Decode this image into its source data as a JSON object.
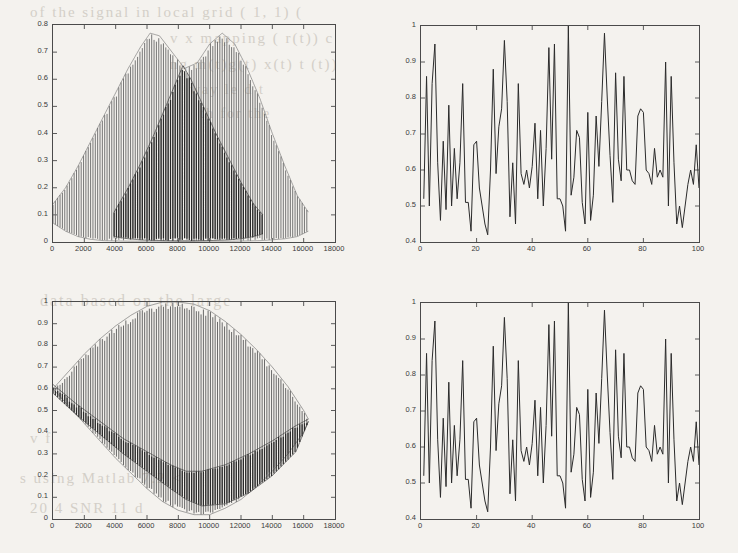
{
  "figure": {
    "background_color": "#f4f2ee",
    "axis_color": "#4a4a4a",
    "trace_color": "#2b2b2b",
    "panel_count": 4
  },
  "bleed_text": [
    "of the  signal in  local grid   (  1, 1)  ( ",
    "v   x    mapping  (   r(t))    c",
    "ng   m(t)g(t)        x(t)          t   (t))",
    "way  le                 d  t",
    "th   for   the",
    "data based on the large",
    "v   f",
    "s  using Matlab 7.2 <",
    "20    4  SNR 11  d"
  ],
  "panels": [
    {
      "id": "top-left",
      "name": "composite-modulated-signal-plot",
      "chart_data": {
        "type": "line",
        "title": "",
        "xlabel": "",
        "ylabel": "",
        "xlim": [
          0,
          18000
        ],
        "ylim": [
          0,
          0.8
        ],
        "xticks": [
          0,
          2000,
          4000,
          6000,
          8000,
          10000,
          12000,
          14000,
          16000,
          18000
        ],
        "yticks": [
          0,
          0.1,
          0.2,
          0.3,
          0.4,
          0.5,
          0.6,
          0.7,
          0.8
        ],
        "xtick_labels": [
          "0",
          "2000",
          "4000",
          "6000",
          "8000",
          "10000",
          "12000",
          "14000",
          "16000",
          "18000"
        ],
        "ytick_labels": [
          "0",
          "0.1",
          "0.2",
          "0.3",
          "0.4",
          "0.5",
          "0.6",
          "0.7",
          "0.8"
        ],
        "grid": false,
        "legend": "none",
        "description": "Dense high-frequency oscillation filling two overlapping bell envelopes plus a darker inner triangular envelope.",
        "data_extent_x": [
          0,
          16300
        ],
        "oscillation_period_x": 150,
        "envelopes": [
          {
            "name": "outer-envelope-hump-1",
            "shade": "#6b6b6b",
            "x": [
              0,
              800,
              1600,
              2400,
              3200,
              4000,
              4800,
              5600,
              6200,
              6800,
              7600,
              8400,
              9200,
              10000,
              10800,
              11600,
              12400,
              13200,
              14000,
              14800,
              15600,
              16300
            ],
            "y_upper": [
              0.14,
              0.2,
              0.28,
              0.37,
              0.46,
              0.55,
              0.64,
              0.72,
              0.77,
              0.76,
              0.7,
              0.64,
              0.66,
              0.73,
              0.77,
              0.73,
              0.64,
              0.53,
              0.4,
              0.28,
              0.17,
              0.11
            ],
            "y_lower": [
              0.07,
              0.04,
              0.02,
              0.01,
              0.005,
              0.004,
              0.003,
              0.003,
              0.003,
              0.003,
              0.003,
              0.003,
              0.003,
              0.003,
              0.003,
              0.003,
              0.004,
              0.005,
              0.008,
              0.012,
              0.02,
              0.04
            ]
          },
          {
            "name": "inner-envelope-triangle",
            "shade": "#242424",
            "x": [
              3900,
              4800,
              5600,
              6400,
              7200,
              8000,
              8300,
              8800,
              9600,
              10400,
              11200,
              12000,
              12800,
              13400
            ],
            "y_upper": [
              0.11,
              0.2,
              0.29,
              0.39,
              0.5,
              0.61,
              0.65,
              0.6,
              0.5,
              0.4,
              0.31,
              0.22,
              0.14,
              0.1
            ],
            "y_lower": [
              0.02,
              0.012,
              0.008,
              0.006,
              0.005,
              0.004,
              0.004,
              0.004,
              0.005,
              0.006,
              0.008,
              0.012,
              0.02,
              0.03
            ]
          }
        ]
      }
    },
    {
      "id": "top-right",
      "name": "extracted-feature-series-plot-a",
      "chart_data": {
        "type": "line",
        "title": "",
        "xlabel": "",
        "ylabel": "",
        "xlim": [
          0,
          100
        ],
        "ylim": [
          0.4,
          1.0
        ],
        "xticks": [
          0,
          20,
          40,
          60,
          80,
          100
        ],
        "yticks": [
          0.4,
          0.5,
          0.6,
          0.7,
          0.8,
          0.9,
          1.0
        ],
        "xtick_labels": [
          "0",
          "20",
          "40",
          "60",
          "80",
          "100"
        ],
        "ytick_labels": [
          "0.4",
          "0.5",
          "0.6",
          "0.7",
          "0.8",
          "0.9",
          "1"
        ],
        "grid": false,
        "legend": "none",
        "description": "Noisy, spiky normalized time series of 100 samples oscillating between about 0.42 and 1.00.",
        "x": [
          1,
          2,
          3,
          4,
          5,
          6,
          7,
          8,
          9,
          10,
          11,
          12,
          13,
          14,
          15,
          16,
          17,
          18,
          19,
          20,
          21,
          22,
          23,
          24,
          25,
          26,
          27,
          28,
          29,
          30,
          31,
          32,
          33,
          34,
          35,
          36,
          37,
          38,
          39,
          40,
          41,
          42,
          43,
          44,
          45,
          46,
          47,
          48,
          49,
          50,
          51,
          52,
          53,
          54,
          55,
          56,
          57,
          58,
          59,
          60,
          61,
          62,
          63,
          64,
          65,
          66,
          67,
          68,
          69,
          70,
          71,
          72,
          73,
          74,
          75,
          76,
          77,
          78,
          79,
          80,
          81,
          82,
          83,
          84,
          85,
          86,
          87,
          88,
          89,
          90,
          91,
          92,
          93,
          94,
          95,
          96,
          97,
          98,
          99,
          100
        ],
        "values": [
          0.52,
          0.86,
          0.5,
          0.84,
          0.95,
          0.62,
          0.46,
          0.68,
          0.49,
          0.78,
          0.5,
          0.66,
          0.52,
          0.62,
          0.84,
          0.51,
          0.51,
          0.43,
          0.67,
          0.68,
          0.55,
          0.5,
          0.45,
          0.42,
          0.6,
          0.88,
          0.59,
          0.72,
          0.77,
          0.96,
          0.79,
          0.47,
          0.62,
          0.45,
          0.84,
          0.59,
          0.56,
          0.6,
          0.55,
          0.61,
          0.73,
          0.52,
          0.71,
          0.5,
          0.66,
          0.94,
          0.63,
          0.95,
          0.52,
          0.52,
          0.5,
          0.43,
          1.0,
          0.53,
          0.58,
          0.71,
          0.69,
          0.51,
          0.45,
          0.76,
          0.46,
          0.53,
          0.75,
          0.61,
          0.79,
          0.98,
          0.8,
          0.64,
          0.51,
          0.87,
          0.63,
          0.57,
          0.86,
          0.6,
          0.6,
          0.57,
          0.56,
          0.75,
          0.77,
          0.76,
          0.6,
          0.59,
          0.56,
          0.66,
          0.58,
          0.6,
          0.58,
          0.9,
          0.5,
          0.86,
          0.62,
          0.45,
          0.5,
          0.44,
          0.5,
          0.56,
          0.6,
          0.56,
          0.67,
          0.55
        ]
      }
    },
    {
      "id": "bottom-left",
      "name": "lens-envelope-modulated-signal-plot",
      "chart_data": {
        "type": "line",
        "title": "",
        "xlabel": "",
        "ylabel": "",
        "xlim": [
          0,
          18000
        ],
        "ylim": [
          0,
          1.0
        ],
        "xticks": [
          0,
          2000,
          4000,
          6000,
          8000,
          10000,
          12000,
          14000,
          16000,
          18000
        ],
        "yticks": [
          0,
          0.1,
          0.2,
          0.3,
          0.4,
          0.5,
          0.6,
          0.7,
          0.8,
          0.9,
          1.0
        ],
        "xtick_labels": [
          "0",
          "2000",
          "4000",
          "6000",
          "8000",
          "10000",
          "12000",
          "14000",
          "16000",
          "18000"
        ],
        "ytick_labels": [
          "0",
          "0.1",
          "0.2",
          "0.3",
          "0.4",
          "0.5",
          "0.6",
          "0.7",
          "0.8",
          "0.9",
          "1"
        ],
        "grid": false,
        "legend": "none",
        "description": "Dense oscillation filling a lens/eye shape; upper envelope rises from 0.6 to 1.0 near x=8000 then falls to 0.45, lower envelope falls from 0.6 to near 0.02 near x=8800 then rises to 0.45.",
        "data_extent_x": [
          0,
          16300
        ],
        "oscillation_period_x": 150,
        "envelopes": [
          {
            "name": "lens-envelope",
            "shade": "#5e5e5e",
            "x": [
              0,
              1000,
              2000,
              3000,
              4000,
              5000,
              6000,
              7000,
              8000,
              9000,
              10000,
              11000,
              12000,
              13000,
              14000,
              15000,
              16000,
              16300
            ],
            "y_upper": [
              0.6,
              0.68,
              0.76,
              0.83,
              0.89,
              0.94,
              0.98,
              1.0,
              1.0,
              0.99,
              0.96,
              0.91,
              0.85,
              0.78,
              0.7,
              0.61,
              0.5,
              0.46
            ],
            "y_lower": [
              0.6,
              0.52,
              0.44,
              0.36,
              0.28,
              0.21,
              0.14,
              0.08,
              0.04,
              0.02,
              0.02,
              0.05,
              0.09,
              0.15,
              0.22,
              0.3,
              0.4,
              0.45
            ]
          },
          {
            "name": "inner-dark-band",
            "shade": "#262626",
            "x": [
              0,
              1500,
              3000,
              4500,
              6000,
              7500,
              8500,
              9500,
              11000,
              12500,
              14000,
              15500,
              16300
            ],
            "y_upper": [
              0.62,
              0.53,
              0.45,
              0.37,
              0.31,
              0.25,
              0.22,
              0.22,
              0.25,
              0.3,
              0.36,
              0.43,
              0.46
            ],
            "y_lower": [
              0.58,
              0.48,
              0.39,
              0.3,
              0.22,
              0.14,
              0.09,
              0.06,
              0.07,
              0.12,
              0.2,
              0.31,
              0.45
            ]
          }
        ]
      }
    },
    {
      "id": "bottom-right",
      "name": "extracted-feature-series-plot-b",
      "chart_data": {
        "type": "line",
        "title": "",
        "xlabel": "",
        "ylabel": "",
        "xlim": [
          0,
          100
        ],
        "ylim": [
          0.4,
          1.0
        ],
        "xticks": [
          0,
          20,
          40,
          60,
          80,
          100
        ],
        "yticks": [
          0.4,
          0.5,
          0.6,
          0.7,
          0.8,
          0.9,
          1.0
        ],
        "xtick_labels": [
          "0",
          "20",
          "40",
          "60",
          "80",
          "100"
        ],
        "ytick_labels": [
          "0.4",
          "0.5",
          "0.6",
          "0.7",
          "0.8",
          "0.9",
          "1"
        ],
        "grid": false,
        "legend": "none",
        "description": "Reconstructed series nearly identical to the upper-right panel; 100 samples ranging about 0.42 to 1.00.",
        "x": [
          1,
          2,
          3,
          4,
          5,
          6,
          7,
          8,
          9,
          10,
          11,
          12,
          13,
          14,
          15,
          16,
          17,
          18,
          19,
          20,
          21,
          22,
          23,
          24,
          25,
          26,
          27,
          28,
          29,
          30,
          31,
          32,
          33,
          34,
          35,
          36,
          37,
          38,
          39,
          40,
          41,
          42,
          43,
          44,
          45,
          46,
          47,
          48,
          49,
          50,
          51,
          52,
          53,
          54,
          55,
          56,
          57,
          58,
          59,
          60,
          61,
          62,
          63,
          64,
          65,
          66,
          67,
          68,
          69,
          70,
          71,
          72,
          73,
          74,
          75,
          76,
          77,
          78,
          79,
          80,
          81,
          82,
          83,
          84,
          85,
          86,
          87,
          88,
          89,
          90,
          91,
          92,
          93,
          94,
          95,
          96,
          97,
          98,
          99,
          100
        ],
        "values": [
          0.52,
          0.86,
          0.5,
          0.84,
          0.95,
          0.62,
          0.46,
          0.68,
          0.49,
          0.78,
          0.5,
          0.66,
          0.52,
          0.62,
          0.84,
          0.51,
          0.51,
          0.43,
          0.67,
          0.68,
          0.55,
          0.5,
          0.45,
          0.42,
          0.6,
          0.88,
          0.59,
          0.72,
          0.77,
          0.96,
          0.79,
          0.47,
          0.62,
          0.45,
          0.84,
          0.59,
          0.56,
          0.6,
          0.55,
          0.61,
          0.73,
          0.52,
          0.71,
          0.5,
          0.66,
          0.94,
          0.63,
          0.95,
          0.52,
          0.52,
          0.5,
          0.43,
          1.0,
          0.53,
          0.58,
          0.71,
          0.69,
          0.51,
          0.45,
          0.76,
          0.46,
          0.53,
          0.75,
          0.61,
          0.79,
          0.98,
          0.8,
          0.64,
          0.51,
          0.87,
          0.63,
          0.57,
          0.86,
          0.6,
          0.6,
          0.57,
          0.56,
          0.75,
          0.77,
          0.76,
          0.6,
          0.59,
          0.56,
          0.66,
          0.58,
          0.6,
          0.58,
          0.9,
          0.5,
          0.86,
          0.62,
          0.45,
          0.5,
          0.44,
          0.5,
          0.56,
          0.6,
          0.56,
          0.67,
          0.55
        ]
      }
    }
  ]
}
